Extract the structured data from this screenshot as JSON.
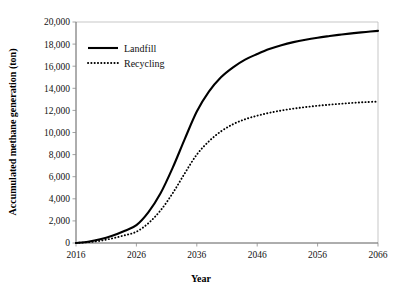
{
  "chart_data": {
    "type": "line",
    "title": "",
    "xlabel": "Year",
    "ylabel": "Accumulated methane generation (ton)",
    "xlim": [
      2016,
      2066
    ],
    "ylim": [
      0,
      20000
    ],
    "grid": false,
    "legend_position": "upper-left-inside",
    "x_ticks": [
      "2016",
      "2026",
      "2036",
      "2046",
      "2056",
      "2066"
    ],
    "x_tick_values": [
      2016,
      2026,
      2036,
      2046,
      2056,
      2066
    ],
    "y_ticks": [
      "0",
      "2,000",
      "4,000",
      "6,000",
      "8,000",
      "10,000",
      "12,000",
      "14,000",
      "16,000",
      "18,000",
      "20,000"
    ],
    "y_tick_values": [
      0,
      2000,
      4000,
      6000,
      8000,
      10000,
      12000,
      14000,
      16000,
      18000,
      20000
    ],
    "x": [
      2016,
      2018,
      2020,
      2022,
      2024,
      2026,
      2028,
      2030,
      2032,
      2034,
      2036,
      2038,
      2040,
      2042,
      2044,
      2046,
      2048,
      2050,
      2052,
      2054,
      2056,
      2058,
      2060,
      2062,
      2064,
      2066
    ],
    "series": [
      {
        "name": "Landfill",
        "style": "solid",
        "color": "#000000",
        "values": [
          0,
          120,
          330,
          650,
          1080,
          1620,
          2800,
          4500,
          6800,
          9400,
          11900,
          13700,
          15000,
          15900,
          16600,
          17100,
          17550,
          17900,
          18180,
          18400,
          18580,
          18730,
          18870,
          18990,
          19100,
          19200
        ]
      },
      {
        "name": "Recycling",
        "style": "dotted",
        "color": "#000000",
        "values": [
          0,
          70,
          200,
          420,
          690,
          1020,
          1800,
          2950,
          4500,
          6300,
          8000,
          9200,
          10100,
          10750,
          11200,
          11520,
          11780,
          11990,
          12160,
          12300,
          12420,
          12520,
          12610,
          12690,
          12750,
          12800
        ]
      }
    ]
  },
  "legend": {
    "items": [
      {
        "label": "Landfill",
        "style": "solid"
      },
      {
        "label": "Recycling",
        "style": "dotted"
      }
    ]
  }
}
